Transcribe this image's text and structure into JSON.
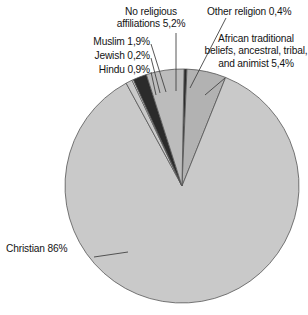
{
  "chart_data": {
    "type": "pie",
    "title": "",
    "subtitle": "",
    "xlabel": "",
    "ylabel": "",
    "legend_position": "none",
    "grid": false,
    "value_suffix": "%",
    "decimal_separator": ",",
    "categories": [
      "Other religion",
      "African traditional beliefs, ancestral, tribal, and animist",
      "Christian",
      "Hindu",
      "Jewish",
      "Muslim",
      "No religious affiliations"
    ],
    "values": [
      0.4,
      5.4,
      86,
      0.9,
      0.2,
      1.9,
      5.2
    ],
    "slices": [
      {
        "name": "other-religion",
        "label": "Other religion 0,4%",
        "category": "Other religion",
        "value": 0.4,
        "value_text": "0,4%",
        "color": "#2b2b2b"
      },
      {
        "name": "african-traditional",
        "label": "African traditional beliefs, ancestral, tribal, and animist 5,4%",
        "category": "African traditional beliefs, ancestral, tribal, and animist",
        "value": 5.4,
        "value_text": "5,4%",
        "color": "#b2b2b2"
      },
      {
        "name": "christian",
        "label": "Christian 86%",
        "category": "Christian",
        "value": 86,
        "value_text": "86%",
        "color": "#c9c9c9"
      },
      {
        "name": "hindu",
        "label": "Hindu 0,9%",
        "category": "Hindu",
        "value": 0.9,
        "value_text": "0,9%",
        "color": "#c9c9c9"
      },
      {
        "name": "jewish",
        "label": "Jewish 0,2%",
        "category": "Jewish",
        "value": 0.2,
        "value_text": "0,2%",
        "color": "#ffffff"
      },
      {
        "name": "muslim",
        "label": "Muslim 1,9%",
        "category": "Muslim",
        "value": 1.9,
        "value_text": "1,9%",
        "color": "#2b2b2b"
      },
      {
        "name": "no-religious-affiliations",
        "label": "No religious affiliations 5,2%",
        "category": "No religious affiliations",
        "value": 5.2,
        "value_text": "5,2%",
        "color": "#bcbcbc"
      }
    ]
  },
  "labels": {
    "muslim": "Muslim 1,9%",
    "jewish": "Jewish 0,2%",
    "hindu": "Hindu 0,9%",
    "no_religious_affiliations": "No religious\naffiliations 5,2%",
    "other_religion": "Other religion 0,4%",
    "african_traditional": "African traditional\nbeliefs, ancestral,\ntribal, and animist\n5,4%",
    "christian": "Christian 86%"
  },
  "style": {
    "background": "#ffffff",
    "outline": "#555555",
    "leader_line": "#444444",
    "text": "#141414"
  },
  "geometry": {
    "center_x": 182,
    "center_y": 186,
    "radius": 117
  }
}
